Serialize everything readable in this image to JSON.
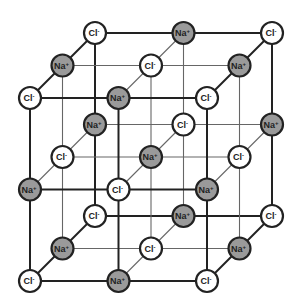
{
  "diagram": {
    "title": "",
    "type": "crystal-lattice",
    "grid": {
      "nx": 3,
      "ny": 3,
      "nz": 3
    },
    "projection": {
      "origin_x": 30,
      "origin_y": 98,
      "step_x": 88.5,
      "step_y": 91.5,
      "depth_dx": 32.5,
      "depth_dy": -32.5
    },
    "ion_radius": 11,
    "species": {
      "cl": {
        "symbol": "Cl",
        "charge": "-",
        "fill": "#ffffff",
        "text_color": "#222222"
      },
      "na": {
        "symbol": "Na",
        "charge": "+",
        "fill": "#9a9a9a",
        "text_color": "#222222"
      }
    },
    "stroke_color": "#222222",
    "thin_stroke_color": "#666666",
    "ions": [
      {
        "i": 0,
        "j": 0,
        "k": 0,
        "species": "cl"
      },
      {
        "i": 1,
        "j": 0,
        "k": 0,
        "species": "na"
      },
      {
        "i": 2,
        "j": 0,
        "k": 0,
        "species": "cl"
      },
      {
        "i": 0,
        "j": 1,
        "k": 0,
        "species": "na"
      },
      {
        "i": 1,
        "j": 1,
        "k": 0,
        "species": "cl"
      },
      {
        "i": 2,
        "j": 1,
        "k": 0,
        "species": "na"
      },
      {
        "i": 0,
        "j": 2,
        "k": 0,
        "species": "cl"
      },
      {
        "i": 1,
        "j": 2,
        "k": 0,
        "species": "na"
      },
      {
        "i": 2,
        "j": 2,
        "k": 0,
        "species": "cl"
      },
      {
        "i": 0,
        "j": 0,
        "k": 1,
        "species": "na"
      },
      {
        "i": 1,
        "j": 0,
        "k": 1,
        "species": "cl"
      },
      {
        "i": 2,
        "j": 0,
        "k": 1,
        "species": "na"
      },
      {
        "i": 0,
        "j": 1,
        "k": 1,
        "species": "cl"
      },
      {
        "i": 1,
        "j": 1,
        "k": 1,
        "species": "na"
      },
      {
        "i": 2,
        "j": 1,
        "k": 1,
        "species": "cl"
      },
      {
        "i": 0,
        "j": 2,
        "k": 1,
        "species": "na"
      },
      {
        "i": 1,
        "j": 2,
        "k": 1,
        "species": "cl"
      },
      {
        "i": 2,
        "j": 2,
        "k": 1,
        "species": "na"
      },
      {
        "i": 0,
        "j": 0,
        "k": 2,
        "species": "cl"
      },
      {
        "i": 1,
        "j": 0,
        "k": 2,
        "species": "na"
      },
      {
        "i": 2,
        "j": 0,
        "k": 2,
        "species": "cl"
      },
      {
        "i": 0,
        "j": 1,
        "k": 2,
        "species": "na"
      },
      {
        "i": 1,
        "j": 1,
        "k": 2,
        "species": "cl"
      },
      {
        "i": 2,
        "j": 1,
        "k": 2,
        "species": "na"
      },
      {
        "i": 0,
        "j": 2,
        "k": 2,
        "species": "cl"
      },
      {
        "i": 1,
        "j": 2,
        "k": 2,
        "species": "na"
      },
      {
        "i": 2,
        "j": 2,
        "k": 2,
        "species": "cl"
      }
    ],
    "labels": {
      "cl": "Cl",
      "cl_charge": "-",
      "na": "Na",
      "na_charge": "+"
    }
  }
}
